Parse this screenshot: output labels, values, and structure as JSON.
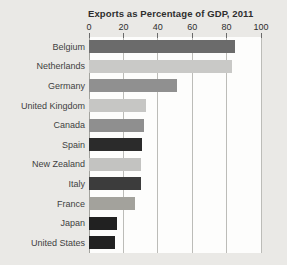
{
  "page": {
    "background_color": "#eae9e6"
  },
  "chart_data": {
    "type": "bar",
    "orientation": "horizontal",
    "title": "Exports as Percentage of GDP, 2011",
    "categories": [
      "Belgium",
      "Netherlands",
      "Germany",
      "United Kingdom",
      "Canada",
      "Spain",
      "New Zealand",
      "Italy",
      "France",
      "Japan",
      "United States"
    ],
    "values": [
      85,
      83,
      51,
      33,
      32,
      31,
      30,
      30,
      27,
      16,
      15
    ],
    "bar_colors": [
      "#6b6b6b",
      "#c9c9c7",
      "#909090",
      "#c6c6c4",
      "#8f8f8f",
      "#2b2b2b",
      "#c3c3c1",
      "#3c3c3c",
      "#a3a29c",
      "#212121",
      "#212121"
    ],
    "xlabel": "",
    "ylabel": "",
    "x_ticks": [
      0,
      20,
      40,
      60,
      80,
      100
    ],
    "xlim": [
      0,
      100
    ],
    "grid": "vertical",
    "legend": "none",
    "plot_background": "#fdfdfc",
    "gridline_color": "#bcbcb8"
  }
}
